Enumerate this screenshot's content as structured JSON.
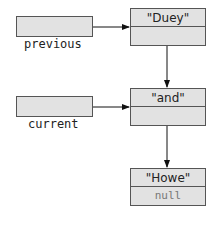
{
  "diagram": {
    "type": "linked-list-pointers",
    "variables": [
      {
        "name": "previous",
        "points_to": "Duey"
      },
      {
        "name": "current",
        "points_to": "and"
      }
    ],
    "nodes": [
      {
        "value": "\"Duey\"",
        "next": "and"
      },
      {
        "value": "\"and\"",
        "next": "Howe"
      },
      {
        "value": "\"Howe\"",
        "next": "null"
      }
    ],
    "null_label": "null"
  }
}
